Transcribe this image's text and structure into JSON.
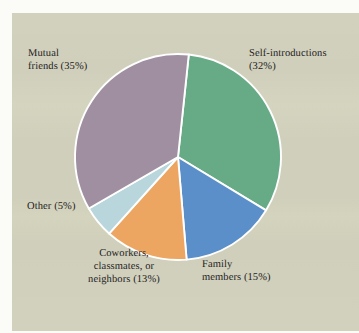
{
  "figure": {
    "background_color": "#cfcfbb",
    "page_color": "#fbfbf7",
    "divider_color": "#ffffff",
    "text_color": "#24201c"
  },
  "chart_data": {
    "type": "pie",
    "title": "",
    "subtitle": "",
    "xlabel": "",
    "ylabel": "",
    "legend_position": "none",
    "grid": false,
    "units": "percent",
    "total": 100,
    "start_angle_deg": 6,
    "direction": "clockwise",
    "categories": [
      "Self-introductions",
      "Family members",
      "Coworkers, classmates, or neighbors",
      "Other",
      "Mutual friends"
    ],
    "values": [
      32,
      15,
      13,
      5,
      35
    ],
    "colors": [
      "#66ab86",
      "#5b8fc9",
      "#eda661",
      "#b9d6dc",
      "#a08fa0"
    ],
    "slices": [
      {
        "name": "Self-introductions",
        "value": 32,
        "color": "#66ab86",
        "label": "Self-introductions\n(32%)"
      },
      {
        "name": "Family members",
        "value": 15,
        "color": "#5b8fc9",
        "label": "Family\nmembers (15%)"
      },
      {
        "name": "Coworkers, classmates, or neighbors",
        "value": 13,
        "color": "#eda661",
        "label": "Coworkers,\nclassmates, or\nneighbors (13%)"
      },
      {
        "name": "Other",
        "value": 5,
        "color": "#b9d6dc",
        "label": "Other (5%)"
      },
      {
        "name": "Mutual friends",
        "value": 35,
        "color": "#a08fa0",
        "label": "Mutual\nfriends (35%)"
      }
    ]
  },
  "labels": {
    "mutual_friends": "Mutual\nfriends (35%)",
    "self_introductions": "Self-introductions\n(32%)",
    "family_members": "Family\nmembers (15%)",
    "coworkers": "Coworkers,\nclassmates, or\nneighbors (13%)",
    "other": "Other (5%)"
  }
}
